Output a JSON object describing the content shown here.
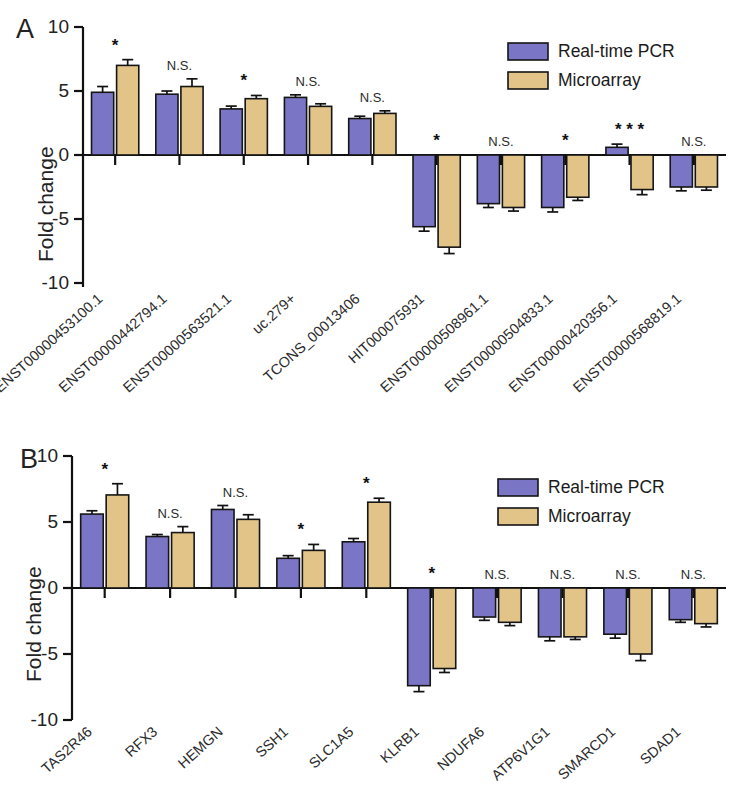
{
  "figure": {
    "y_axis_title": "Fold change",
    "legend": [
      {
        "key": "pcr",
        "label": "Real-time PCR",
        "color": "#7b75c6"
      },
      {
        "key": "micro",
        "label": "Microarray",
        "color": "#e2c489"
      }
    ]
  },
  "panels": [
    {
      "letter": "A",
      "chart_data": {
        "type": "bar",
        "title": "",
        "xlabel": "",
        "ylabel": "Fold change",
        "ylim": [
          -10,
          10
        ],
        "yticks": [
          10,
          5,
          0,
          -5,
          -10
        ],
        "ytick_labels": [
          "10",
          "5",
          "0",
          "-5",
          "-10"
        ],
        "grid": false,
        "legend_position": "top-right",
        "categories": [
          "ENST00000453100.1",
          "ENST00000442794.1",
          "ENST00000563521.1",
          "uc.279+",
          "TCONS_00013406",
          "HIT000075931",
          "ENST00000508961.1",
          "ENST00000504833.1",
          "ENST00000420356.1",
          "ENST00000568819.1"
        ],
        "series": [
          {
            "name": "Real-time PCR",
            "color": "#7b75c6",
            "values": [
              4.9,
              4.75,
              3.6,
              4.5,
              2.85,
              -5.6,
              -3.8,
              -4.1,
              0.6,
              -2.5
            ],
            "errors": [
              0.45,
              0.25,
              0.22,
              0.2,
              0.18,
              0.35,
              0.3,
              0.35,
              0.25,
              0.3
            ]
          },
          {
            "name": "Microarray",
            "color": "#e2c489",
            "values": [
              7.0,
              5.35,
              4.4,
              3.8,
              3.25,
              -7.2,
              -4.1,
              -3.3,
              -2.7,
              -2.5
            ],
            "errors": [
              0.45,
              0.6,
              0.25,
              0.2,
              0.2,
              0.5,
              0.28,
              0.25,
              0.4,
              0.25
            ]
          }
        ],
        "significance": [
          "*",
          "N.S.",
          "*",
          "N.S.",
          "N.S.",
          "*",
          "N.S.",
          "*",
          "***",
          "N.S."
        ]
      }
    },
    {
      "letter": "B",
      "chart_data": {
        "type": "bar",
        "title": "",
        "xlabel": "",
        "ylabel": "Fold change",
        "ylim": [
          -10,
          10
        ],
        "yticks": [
          10,
          5,
          0,
          -5,
          -10
        ],
        "ytick_labels": [
          "10",
          "5",
          "0",
          "-5",
          "-10"
        ],
        "grid": false,
        "legend_position": "top-right",
        "categories": [
          "TAS2R46",
          "RFX3",
          "HEMGN",
          "SSH1",
          "SLC1A5",
          "KLRB1",
          "NDUFA6",
          "ATP6V1G1",
          "SMARCD1",
          "SDAD1"
        ],
        "series": [
          {
            "name": "Real-time PCR",
            "color": "#7b75c6",
            "values": [
              5.6,
              3.9,
              5.95,
              2.25,
              3.5,
              -7.4,
              -2.2,
              -3.7,
              -3.5,
              -2.4
            ],
            "errors": [
              0.25,
              0.15,
              0.3,
              0.2,
              0.25,
              0.45,
              0.25,
              0.3,
              0.3,
              0.2
            ]
          },
          {
            "name": "Microarray",
            "color": "#e2c489",
            "values": [
              7.05,
              4.2,
              5.2,
              2.85,
              6.5,
              -6.1,
              -2.6,
              -3.7,
              -5.0,
              -2.7
            ],
            "errors": [
              0.85,
              0.45,
              0.35,
              0.45,
              0.3,
              0.3,
              0.25,
              0.2,
              0.5,
              0.25
            ]
          }
        ],
        "significance": [
          "*",
          "N.S.",
          "N.S.",
          "*",
          "*",
          "*",
          "N.S.",
          "N.S.",
          "N.S.",
          "N.S."
        ]
      }
    }
  ]
}
